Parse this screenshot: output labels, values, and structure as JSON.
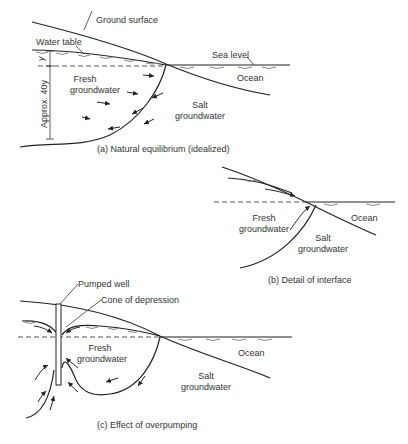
{
  "panels": [
    {
      "id": "a",
      "caption": "(a)  Natural equilibrium (idealized)",
      "labels": {
        "ground_surface": "Ground surface",
        "water_table": "Water table",
        "sea_level": "Sea level",
        "ocean": "Ocean",
        "fresh": [
          "Fresh",
          "groundwater"
        ],
        "salt": [
          "Salt",
          "groundwater"
        ],
        "y": "y",
        "depth": "Approx. 40y"
      }
    },
    {
      "id": "b",
      "caption": "(b)  Detail of interface",
      "labels": {
        "ocean": "Ocean",
        "fresh": [
          "Fresh",
          "groundwater"
        ],
        "salt": [
          "Salt",
          "groundwater"
        ]
      }
    },
    {
      "id": "c",
      "caption": "(c)  Effect of overpumping",
      "labels": {
        "pumped_well": "Pumped well",
        "cone": "Cone of depression",
        "ocean": "Ocean",
        "fresh": [
          "Fresh",
          "groundwater"
        ],
        "salt": [
          "Salt",
          "groundwater"
        ]
      }
    }
  ]
}
